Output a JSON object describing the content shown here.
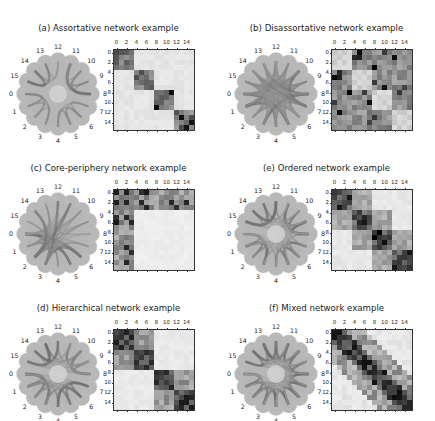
{
  "figure": {
    "node_labels": [
      "0",
      "1",
      "2",
      "3",
      "4",
      "5",
      "6",
      "7",
      "8",
      "9",
      "10",
      "11",
      "12",
      "13",
      "14",
      "15"
    ],
    "tick_labels": [
      "0",
      "2",
      "4",
      "6",
      "8",
      "10",
      "12",
      "14"
    ],
    "colormap": {
      "low": "#f5f5f5",
      "high": "#000000"
    },
    "node_color": "#b4b4b4",
    "panels": [
      {
        "id": "a",
        "title": "(a) Assortative network example",
        "pos": [
          0,
          0
        ],
        "edge_shade": 0.55,
        "center_light": true
      },
      {
        "id": "b",
        "title": "(b) Disassortative network example",
        "pos": [
          218,
          0
        ],
        "edge_shade": 0.7,
        "center_light": false
      },
      {
        "id": "c",
        "title": "(c) Core-periphery network example",
        "pos": [
          0,
          140
        ],
        "edge_shade": 0.3,
        "center_light": false
      },
      {
        "id": "e",
        "title": "(e) Ordered network example",
        "pos": [
          218,
          140
        ],
        "edge_shade": 0.6,
        "center_light": true
      },
      {
        "id": "d",
        "title": "(d) Hierarchical network example",
        "pos": [
          0,
          280
        ],
        "edge_shade": 0.6,
        "center_light": true
      },
      {
        "id": "f",
        "title": "(f) Mixed network example",
        "pos": [
          218,
          280
        ],
        "edge_shade": 0.6,
        "center_light": true
      }
    ]
  },
  "chart_data": [
    {
      "type": "heatmap",
      "title": "(a) Assortative network example",
      "x_ticks": [
        0,
        2,
        4,
        6,
        8,
        10,
        12,
        14
      ],
      "y_ticks": [
        0,
        2,
        4,
        6,
        8,
        10,
        12,
        14
      ],
      "size": 16,
      "description": "four diagonal blocks of 4 nodes: 0-3, 4-7, 8-11, 12-15; off-diagonal near zero",
      "blocks": [
        {
          "rows": [
            0,
            3
          ],
          "cols": [
            0,
            3
          ],
          "level": 0.55
        },
        {
          "rows": [
            4,
            7
          ],
          "cols": [
            4,
            7
          ],
          "level": 0.5
        },
        {
          "rows": [
            8,
            11
          ],
          "cols": [
            8,
            11
          ],
          "level": 0.45
        },
        {
          "rows": [
            12,
            15
          ],
          "cols": [
            12,
            15
          ],
          "level": 0.4
        }
      ],
      "background": 0.05
    },
    {
      "type": "heatmap",
      "title": "(b) Disassortative network example",
      "x_ticks": [
        0,
        2,
        4,
        6,
        8,
        10,
        12,
        14
      ],
      "y_ticks": [
        0,
        2,
        4,
        6,
        8,
        10,
        12,
        14
      ],
      "size": 16,
      "description": "diagonal 4x4 blocks light, off-diagonal blocks medium gray with scattered dark cells",
      "blocks": [
        {
          "rows": [
            0,
            3
          ],
          "cols": [
            0,
            3
          ],
          "level": 0.12
        },
        {
          "rows": [
            4,
            7
          ],
          "cols": [
            4,
            7
          ],
          "level": 0.12
        },
        {
          "rows": [
            8,
            11
          ],
          "cols": [
            8,
            11
          ],
          "level": 0.12
        },
        {
          "rows": [
            12,
            15
          ],
          "cols": [
            12,
            15
          ],
          "level": 0.12
        }
      ],
      "background": 0.42
    },
    {
      "type": "heatmap",
      "title": "(c) Core-periphery network example",
      "x_ticks": [
        0,
        2,
        4,
        6,
        8,
        10,
        12,
        14
      ],
      "y_ticks": [
        0,
        2,
        4,
        6,
        8,
        10,
        12,
        14
      ],
      "size": 16,
      "description": "core nodes 0-3 densely connected to all; periphery 4-15 block nearly empty",
      "blocks": [
        {
          "rows": [
            0,
            3
          ],
          "cols": [
            0,
            15
          ],
          "level": 0.45
        },
        {
          "rows": [
            0,
            15
          ],
          "cols": [
            0,
            3
          ],
          "level": 0.45
        },
        {
          "rows": [
            4,
            15
          ],
          "cols": [
            4,
            15
          ],
          "level": 0.03
        }
      ],
      "background": 0.03
    },
    {
      "type": "heatmap",
      "title": "(e) Ordered network example",
      "x_ticks": [
        0,
        2,
        4,
        6,
        8,
        10,
        12,
        14
      ],
      "y_ticks": [
        0,
        2,
        4,
        6,
        8,
        10,
        12,
        14
      ],
      "size": 16,
      "description": "banded structure: diagonal blocks dark, adjacent blocks medium, far blocks light",
      "background": 0.05
    },
    {
      "type": "heatmap",
      "title": "(d) Hierarchical network example",
      "x_ticks": [
        0,
        2,
        4,
        6,
        8,
        10,
        12,
        14
      ],
      "y_ticks": [
        0,
        2,
        4,
        6,
        8,
        10,
        12,
        14
      ],
      "size": 16,
      "description": "two 8x8 groups (0-7, 8-15) each containing two denser 4x4 sub-blocks",
      "background": 0.05
    },
    {
      "type": "heatmap",
      "title": "(f) Mixed network example",
      "x_ticks": [
        0,
        2,
        4,
        6,
        8,
        10,
        12,
        14
      ],
      "y_ticks": [
        0,
        2,
        4,
        6,
        8,
        10,
        12,
        14
      ],
      "size": 16,
      "description": "mixture of assortative diagonal blocks and banded/ordered structure",
      "background": 0.05
    }
  ]
}
